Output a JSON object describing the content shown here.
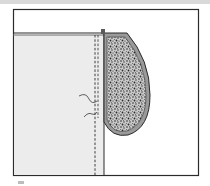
{
  "diagram": {
    "colors": {
      "background": "#ffffff",
      "top_bar": "#d9d9d9",
      "frame_stroke": "#2b2b2b",
      "fabric_panel": "#ececec",
      "pocket_rim": "#8a8a8a",
      "pocket_fill": "#bdbdbd",
      "stipple": "#2a2a2a",
      "thread": "#3a3a3a"
    },
    "elements": [
      "outer-frame",
      "fabric-top-edge",
      "fabric-panel",
      "fold-line",
      "stitch-line",
      "pocket",
      "thread-ends"
    ]
  }
}
